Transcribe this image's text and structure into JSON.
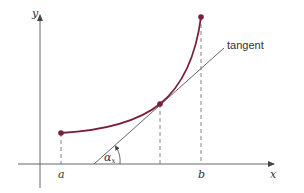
{
  "figure": {
    "axes": {
      "x_label": "x",
      "y_label": "y",
      "axis_color": "#555555"
    },
    "curve": {
      "color": "#7a1f3d",
      "start_point_label": "a",
      "end_point_label": "b"
    },
    "tangent": {
      "label": "tangent",
      "color": "#555555"
    },
    "angle": {
      "label_symbol": "α",
      "label_subscript": "x"
    },
    "ticks": [
      {
        "label": "a"
      },
      {
        "label": "b"
      }
    ]
  }
}
